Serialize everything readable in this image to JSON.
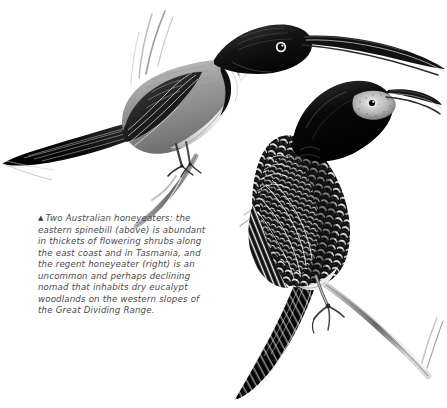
{
  "page": {
    "background_color": "#ffffff",
    "width": 447,
    "height": 408,
    "medium": "black-and-white scraperboard / pen-and-ink illustration"
  },
  "caption": {
    "marker_glyph": "▲",
    "marker_name": "up-triangle-figure-marker",
    "text": "Two Australian honeyeaters: the eastern spinebill (above) is abundant in thickets of flowering shrubs along the east coast and in Tasmania, and the regent honeyeater (right) is an uncommon and perhaps declining nomad that inhabits dry eucalypt woodlands on the western slopes of the Great Dividing Range.",
    "text_color": "#4a4a4f",
    "style": "italic"
  },
  "illustrations": [
    {
      "id": "eastern-spinebill",
      "common_name": "eastern spinebill",
      "position": "above",
      "description": "Perched bird in left profile facing right, long decurved black bill, glossy black crown and nape, white throat with dark breast band, grey-brown mantle, long graduated dark tail sweeping to the left edge, feet gripping a slender twig.",
      "ink_color": "#111111"
    },
    {
      "id": "regent-honeyeater",
      "common_name": "regent honeyeater",
      "position": "right",
      "description": "Upright perched bird facing upper right, black hood and breast, pale warty bare facial skin around eye, heavily scalloped black-and-white scaled plumage on back, wings and flanks, long tapering dark tail angling to lower left, one foot clasping a diagonal branch.",
      "ink_color": "#111111"
    }
  ]
}
